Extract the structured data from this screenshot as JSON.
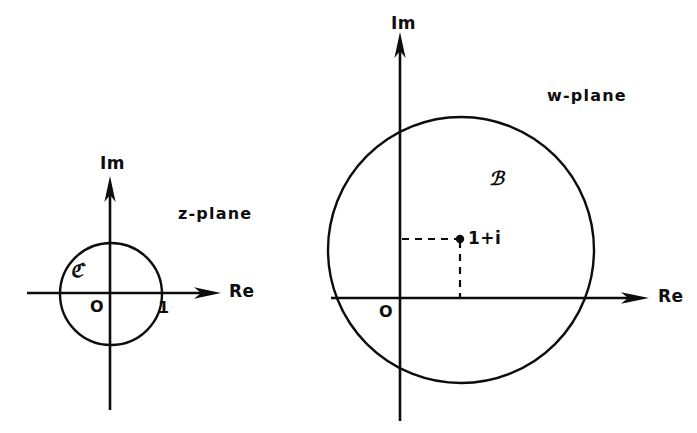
{
  "figure": {
    "background_color": "#ffffff",
    "ink_color": "#0d0d0d",
    "width": 697,
    "height": 433
  },
  "z_plane": {
    "plane_label": "z-plane",
    "imaginary_axis_label": "Im",
    "real_axis_label": "Re",
    "origin_label": "O",
    "tick_label_one": "1",
    "set_label": "ℭ",
    "axes": {
      "origin_x": 110,
      "origin_y": 293,
      "real_axis_start_x": 27,
      "real_axis_end_x": 220,
      "imag_axis_start_y": 410,
      "imag_axis_end_y": 176
    },
    "circle": {
      "center_x": 111,
      "center_y": 294,
      "radius": 51
    }
  },
  "w_plane": {
    "plane_label": "w-plane",
    "imaginary_axis_label": "Im",
    "real_axis_label": "Re",
    "origin_label": "O",
    "point_label": "1+i",
    "set_label": "ℬ",
    "axes": {
      "origin_x": 400,
      "origin_y": 298,
      "real_axis_start_x": 331,
      "real_axis_end_x": 648,
      "imag_axis_start_y": 421,
      "imag_axis_end_y": 32
    },
    "circle": {
      "center_x": 461,
      "center_y": 250,
      "radius": 133
    },
    "marked_point": {
      "x": 460,
      "y": 239
    }
  }
}
